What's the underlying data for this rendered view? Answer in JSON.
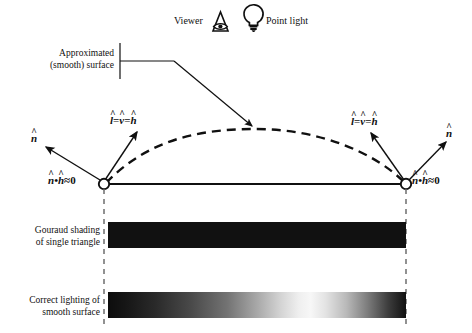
{
  "figure": {
    "title_hidden": "",
    "legend": {
      "viewer_label": "Viewer",
      "viewer_icon": "viewer-eye-triangle-icon",
      "light_label": "Point light",
      "light_icon": "point-light-bulb-icon"
    },
    "annotations": {
      "approx_surface_line1": "Approximated",
      "approx_surface_line2": "(smooth) surface",
      "gouraud_line1": "Gouraud shading",
      "gouraud_line2": "of single triangle",
      "correct_line1": "Correct lighting of",
      "correct_line2": "smooth surface"
    },
    "vectors": {
      "normal_symbol": "n",
      "light_symbol": "l",
      "view_symbol": "v",
      "half_symbol": "h",
      "hat_glyph": "^",
      "equals": "=",
      "dot_glyph": "•",
      "approx_equals": "≈",
      "zero": "0",
      "left_lvh": "l = v = h",
      "right_lvh": "l = v = h",
      "left_dot": "n • h ≈ 0",
      "right_dot": "n • h ≈ 0"
    },
    "geometry": {
      "left_vertex": [
        104,
        184
      ],
      "right_vertex": [
        406,
        184
      ],
      "arc_apex": [
        256,
        129
      ],
      "triangle_edge_y": 184,
      "bar_left_x": 108,
      "bar_right_x": 406,
      "gouraud_bar_y": 222,
      "gouraud_bar_height": 26,
      "correct_bar_y": 292,
      "correct_bar_height": 26
    },
    "colors": {
      "ink": "#101010",
      "bar_gouraud": "#111111",
      "bar_highlight": "#f7f7f7",
      "guide": "#8a8a8a",
      "background": "#ffffff"
    }
  }
}
